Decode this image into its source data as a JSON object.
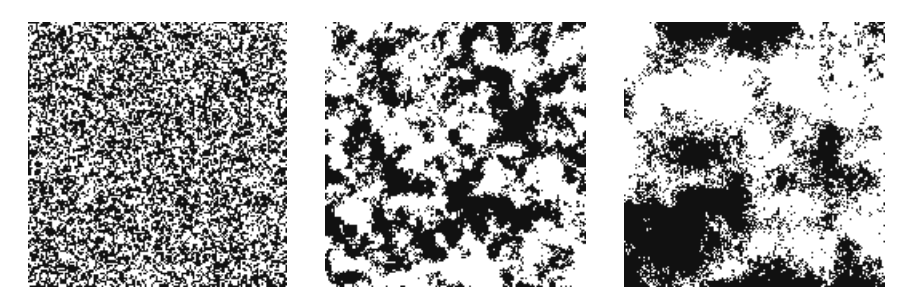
{
  "figure": {
    "background": "#ffffff",
    "ink_color": "#111111",
    "paper_color": "#ffffff",
    "panels": [
      {
        "id": "panel-1",
        "description": "fine-grained random binary texture (short correlation length)",
        "x": 28,
        "y": 22,
        "width": 259,
        "height": 265,
        "cell_size": 1.6,
        "scales": [
          1.2,
          3
        ],
        "weights": [
          1.0,
          0.35
        ],
        "threshold": 0.0,
        "speckle": 0.08,
        "seed": 11
      },
      {
        "id": "panel-2",
        "description": "medium-scale clustered binary texture",
        "x": 325,
        "y": 22,
        "width": 261,
        "height": 265,
        "cell_size": 1.6,
        "scales": [
          2.5,
          8,
          20
        ],
        "weights": [
          0.55,
          1.0,
          0.6
        ],
        "threshold": 0.05,
        "speckle": 0.12,
        "seed": 23
      },
      {
        "id": "panel-3",
        "description": "large-domain binary texture (long correlation length)",
        "x": 624,
        "y": 22,
        "width": 261,
        "height": 265,
        "cell_size": 1.6,
        "scales": [
          3,
          14,
          45
        ],
        "weights": [
          0.45,
          0.7,
          1.0
        ],
        "threshold": 0.02,
        "speckle": 0.14,
        "seed": 37
      }
    ]
  }
}
